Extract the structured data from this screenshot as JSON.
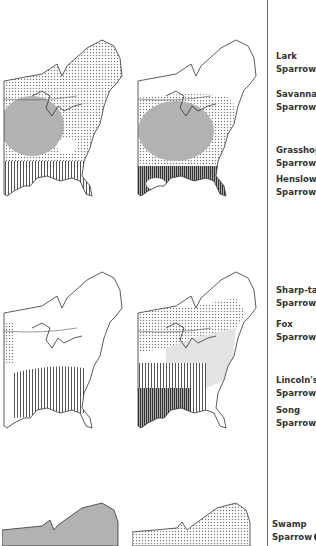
{
  "page": {
    "type": "field-guide range maps",
    "divider_color": "#6a6a6a"
  },
  "maps": [
    {
      "id": "map-top-left",
      "region": "eastern-north-america",
      "patterns": [
        "dots-north",
        "dense-dots-midwest",
        "vertical-lines-south"
      ]
    },
    {
      "id": "map-top-right",
      "region": "eastern-north-america",
      "patterns": [
        "dense-dots-central",
        "vertical-lines-gulf"
      ]
    },
    {
      "id": "map-middle-left",
      "region": "eastern-north-america",
      "patterns": [
        "dots-northwest",
        "vertical-lines-southeast"
      ]
    },
    {
      "id": "map-middle-right",
      "region": "eastern-north-america",
      "patterns": [
        "dots-north",
        "light-gray-central",
        "vertical-lines-southwest"
      ]
    },
    {
      "id": "map-bottom-left",
      "region": "eastern-north-america",
      "patterns": [
        "dense-dots"
      ]
    },
    {
      "id": "map-bottom-right",
      "region": "eastern-north-america",
      "patterns": [
        "light-dots"
      ]
    }
  ],
  "species": [
    {
      "line1": "Lark",
      "line2": "Sparrow"
    },
    {
      "line1": "Savannah",
      "line2": "Sparrow"
    },
    {
      "line1": "Grasshop",
      "line2": "Sparrow"
    },
    {
      "line1": "Henslow's",
      "line2": "Sparrow"
    },
    {
      "line1": "Sharp-tail",
      "line2": "Sparrow"
    },
    {
      "line1": "Fox",
      "line2": "Sparrow"
    },
    {
      "line1": "Lincoln's",
      "line2": "Sparrow"
    },
    {
      "line1": "Song",
      "line2": "Sparrow"
    },
    {
      "line1": "Swamp",
      "line2": "Sparrow"
    }
  ]
}
